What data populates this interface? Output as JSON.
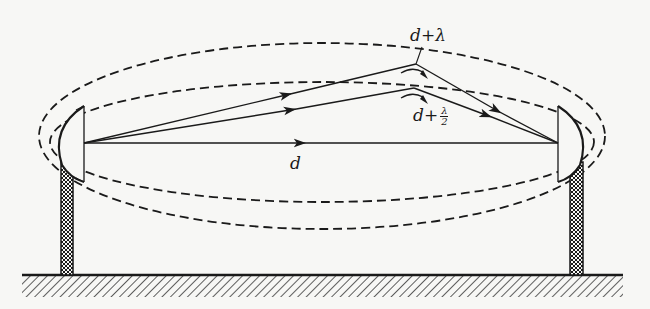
{
  "diagram": {
    "labels": {
      "direct_path": "d",
      "first_zone_path": "d+λ",
      "half_zone_prefix": "d+",
      "half_zone_num": "λ",
      "half_zone_den": "2"
    },
    "colors": {
      "ink": "#1a1a1a",
      "background": "#f7f7f5"
    },
    "elements": {
      "left_antenna": {
        "focus": [
          84,
          143
        ]
      },
      "right_antenna": {
        "focus": [
          558,
          143
        ]
      },
      "direct_ray": {
        "from": [
          84,
          143
        ],
        "to": [
          558,
          143
        ]
      },
      "ray_d_plus_lambda": {
        "points": [
          [
            84,
            143
          ],
          [
            416,
            64
          ],
          [
            558,
            143
          ]
        ]
      },
      "ray_d_plus_half_lambda": {
        "points": [
          [
            84,
            143
          ],
          [
            414,
            88
          ],
          [
            558,
            143
          ]
        ]
      },
      "outer_ellipse": {
        "cx": 322,
        "cy": 136,
        "rx": 283,
        "ry": 93,
        "style": "dashed"
      },
      "inner_ellipse": {
        "cx": 322,
        "cy": 142,
        "rx": 272,
        "ry": 60,
        "style": "dashed"
      },
      "ground": {
        "y": 275,
        "x_from": 22,
        "x_to": 623
      }
    }
  }
}
